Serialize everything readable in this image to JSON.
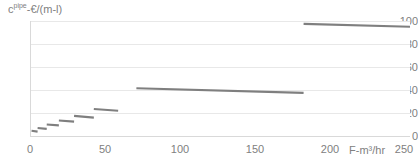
{
  "chart_data": {
    "type": "line",
    "title": "",
    "subtitle": "",
    "ylabel": "c-€/(m-l)",
    "ylabel_prefix": "c",
    "ylabel_sup": "pipe",
    "ylabel_suffix": "-€/(m-l)",
    "xlabel": "F-m³/hr",
    "xlim": [
      0,
      250
    ],
    "ylim": [
      0,
      100
    ],
    "xticks": [
      0,
      50,
      100,
      150,
      200,
      250
    ],
    "yticks": [
      0,
      20,
      40,
      60,
      80,
      100
    ],
    "grid": "horizontal",
    "legend": "none",
    "series_color": "#7f7f7f",
    "grid_color": "#e8e8e8",
    "axis_color": "#d9d9d9",
    "series": [
      {
        "name": "pipe cost step function",
        "segments": [
          {
            "x0": 1,
            "x1": 5,
            "y0": 4.5,
            "y1": 3.8
          },
          {
            "x0": 5,
            "x1": 11,
            "y0": 7.0,
            "y1": 6.2
          },
          {
            "x0": 11,
            "x1": 19,
            "y0": 10.0,
            "y1": 9.2
          },
          {
            "x0": 19,
            "x1": 29,
            "y0": 13.5,
            "y1": 12.5
          },
          {
            "x0": 29,
            "x1": 42,
            "y0": 17.5,
            "y1": 16.0
          },
          {
            "x0": 42,
            "x1": 58,
            "y0": 23.5,
            "y1": 22.0
          },
          {
            "x0": 70,
            "x1": 180,
            "y0": 41.5,
            "y1": 37.5
          },
          {
            "x0": 180,
            "x1": 250,
            "y0": 97.5,
            "y1": 95.0
          }
        ]
      }
    ]
  },
  "axis": {
    "y_tick_labels": [
      "100",
      "80",
      "60",
      "40",
      "20",
      "0"
    ],
    "x_tick_labels": [
      "0",
      "50",
      "100",
      "150",
      "200",
      "250"
    ]
  }
}
